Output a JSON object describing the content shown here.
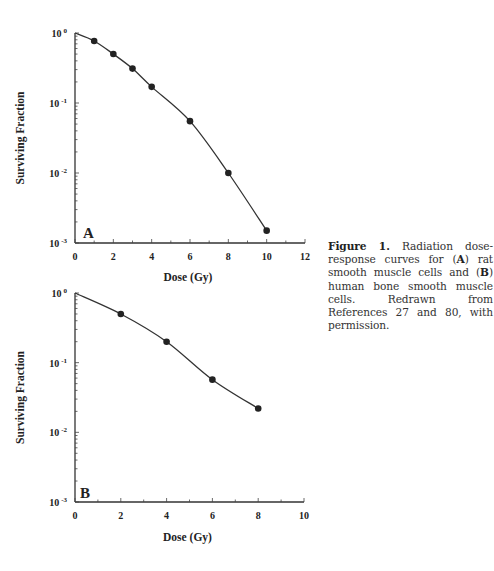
{
  "figure": {
    "caption": {
      "label": "Figure 1.",
      "parts": [
        {
          "text": " Radiation dose-response curves for (",
          "bold": false
        },
        {
          "text": "A",
          "bold": true
        },
        {
          "text": ") rat smooth muscle cells and (",
          "bold": false
        },
        {
          "text": "B",
          "bold": true
        },
        {
          "text": ") human bone smooth muscle cells. Redrawn from References 27 and 80, with permission.",
          "bold": false
        }
      ]
    }
  },
  "chart_data": [
    {
      "type": "line",
      "panel": "A",
      "title": "",
      "xlabel": "Dose (Gy)",
      "ylabel": "Surviving Fraction",
      "yscale": "log",
      "xlim": [
        0,
        12
      ],
      "ylim": [
        0.001,
        1
      ],
      "xticks": [
        0,
        2,
        4,
        6,
        8,
        10,
        12
      ],
      "yticks": [
        "10^0",
        "10^-1",
        "10^-2",
        "10^-3"
      ],
      "grid": false,
      "series": [
        {
          "name": "Rat smooth muscle cells",
          "x": [
            1,
            2,
            3,
            4,
            6,
            8,
            10
          ],
          "values": [
            0.77,
            0.5,
            0.31,
            0.17,
            0.055,
            0.01,
            0.0015
          ],
          "fit_curve_start": [
            0,
            1.0
          ]
        }
      ]
    },
    {
      "type": "line",
      "panel": "B",
      "title": "",
      "xlabel": "Dose (Gy)",
      "ylabel": "Surviving Fraction",
      "yscale": "log",
      "xlim": [
        0,
        10
      ],
      "ylim": [
        0.001,
        1
      ],
      "xticks": [
        0,
        2,
        4,
        6,
        8,
        10
      ],
      "yticks": [
        "10^0",
        "10^-1",
        "10^-2",
        "10^-3"
      ],
      "grid": false,
      "series": [
        {
          "name": "Human bone smooth muscle cells",
          "x": [
            2,
            4,
            6,
            8
          ],
          "values": [
            0.5,
            0.2,
            0.057,
            0.022
          ],
          "fit_curve_start": [
            0,
            1.0
          ]
        }
      ]
    }
  ]
}
